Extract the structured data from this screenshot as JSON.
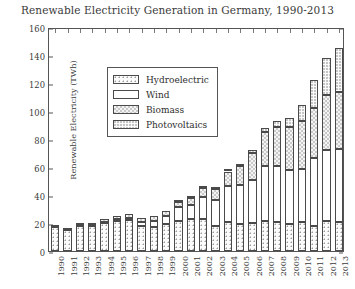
{
  "chart_data": {
    "type": "bar",
    "stacked": true,
    "title": "Renewable Electricity Generation in Germany, 1990-2013",
    "xlabel": "",
    "ylabel": "Renewable Electricity (TWh)",
    "ylim": [
      0,
      160
    ],
    "ytick_step": 20,
    "yticks": [
      "160",
      "140",
      "120",
      "100",
      "80",
      "60",
      "40",
      "20",
      "0"
    ],
    "ytick_values": [
      160,
      140,
      120,
      100,
      80,
      60,
      40,
      20,
      0
    ],
    "grid": false,
    "legend_position": "upper left",
    "categories": [
      "1990",
      "1991",
      "1992",
      "1993",
      "1994",
      "1995",
      "1996",
      "1997",
      "1998",
      "1999",
      "2000",
      "2001",
      "2002",
      "2003",
      "2004",
      "2005",
      "2006",
      "2007",
      "2008",
      "2009",
      "2010",
      "2011",
      "2012",
      "2013"
    ],
    "series": [
      {
        "name": "Hydroelectric",
        "pattern": "coarse-dots",
        "values": [
          17.0,
          14.9,
          18.1,
          17.8,
          19.9,
          21.6,
          21.9,
          17.8,
          17.2,
          19.6,
          21.7,
          22.7,
          23.1,
          17.7,
          20.9,
          19.6,
          20.0,
          21.2,
          20.4,
          19.0,
          20.9,
          17.7,
          21.2,
          21.0
        ]
      },
      {
        "name": "Wind",
        "pattern": "solid-white",
        "values": [
          0.1,
          0.2,
          0.3,
          0.7,
          1.0,
          1.5,
          2.0,
          3.0,
          4.5,
          5.6,
          9.5,
          10.5,
          15.8,
          18.7,
          25.5,
          27.2,
          30.7,
          39.7,
          40.6,
          38.6,
          37.8,
          48.9,
          50.7,
          51.7
        ]
      },
      {
        "name": "Biomass",
        "pattern": "checker",
        "values": [
          1.4,
          1.5,
          1.6,
          1.8,
          2.0,
          2.2,
          2.4,
          2.7,
          3.1,
          3.5,
          4.1,
          5.0,
          6.0,
          8.2,
          10.4,
          14.1,
          19.0,
          23.9,
          27.7,
          31.0,
          34.1,
          35.9,
          39.5,
          41.2
        ]
      },
      {
        "name": "Photovoltaics",
        "pattern": "fine-dots",
        "values": [
          0.0,
          0.0,
          0.0,
          0.0,
          0.0,
          0.0,
          0.0,
          0.0,
          0.0,
          0.0,
          0.1,
          0.1,
          0.2,
          0.3,
          0.6,
          1.3,
          2.2,
          3.1,
          4.4,
          6.6,
          11.7,
          19.6,
          26.4,
          31.0
        ]
      }
    ],
    "totals": [
      18.5,
      16.6,
      20.0,
      20.3,
      22.9,
      25.3,
      26.3,
      23.5,
      24.8,
      28.7,
      35.4,
      38.3,
      45.1,
      44.9,
      57.4,
      62.2,
      71.9,
      87.9,
      93.1,
      95.2,
      104.5,
      122.1,
      137.8,
      144.9
    ]
  },
  "legend": {
    "items": [
      {
        "label": "Hydroelectric"
      },
      {
        "label": "Wind"
      },
      {
        "label": "Biomass"
      },
      {
        "label": "Photovoltaics"
      }
    ]
  },
  "colors": {
    "axis": "#555555",
    "text": "#3a3a3a",
    "bar_outline": "#4a4a4a",
    "background": "#ffffff"
  }
}
